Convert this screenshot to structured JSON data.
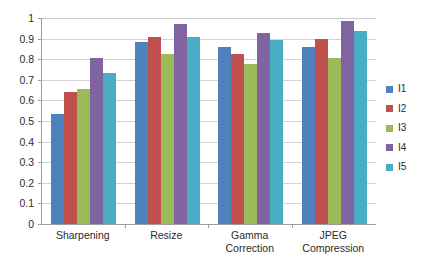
{
  "chart_data": {
    "type": "bar",
    "title": "",
    "subtitle": "",
    "xlabel": "",
    "ylabel": "",
    "ylim": [
      0,
      1
    ],
    "yticks": [
      "0",
      "0.1",
      "0.2",
      "0.3",
      "0.4",
      "0.5",
      "0.6",
      "0.7",
      "0.8",
      "0.9",
      "1"
    ],
    "ytick_values": [
      0,
      0.1,
      0.2,
      0.3,
      0.4,
      0.5,
      0.6,
      0.7,
      0.8,
      0.9,
      1
    ],
    "grid": true,
    "legend_position": "right",
    "categories": [
      "Sharpening",
      "Resize",
      "Gamma Correction",
      "JPEG Compression"
    ],
    "category_lines": [
      [
        "Sharpening"
      ],
      [
        "Resize"
      ],
      [
        "Gamma",
        "Correction"
      ],
      [
        "JPEG",
        "Compression"
      ]
    ],
    "series": [
      {
        "name": "I1",
        "color": "#4F81BD",
        "values": [
          0.535,
          0.885,
          0.86,
          0.86
        ]
      },
      {
        "name": "I2",
        "color": "#C0504D",
        "values": [
          0.64,
          0.91,
          0.825,
          0.9
        ]
      },
      {
        "name": "I3",
        "color": "#9BBB59",
        "values": [
          0.655,
          0.825,
          0.775,
          0.805
        ]
      },
      {
        "name": "I4",
        "color": "#8064A2",
        "values": [
          0.805,
          0.97,
          0.925,
          0.985
        ]
      },
      {
        "name": "I5",
        "color": "#4BACC6",
        "values": [
          0.735,
          0.91,
          0.895,
          0.935
        ]
      }
    ],
    "colors": {
      "series_1": "#4F81BD",
      "series_2": "#C0504D",
      "series_3": "#9BBB59",
      "series_4": "#8064A2",
      "series_5": "#4BACC6",
      "gridline": "#D3D3D3",
      "axis": "#9C9C9C",
      "text": "#2B2B2B",
      "background": "#FFFFFF"
    }
  }
}
